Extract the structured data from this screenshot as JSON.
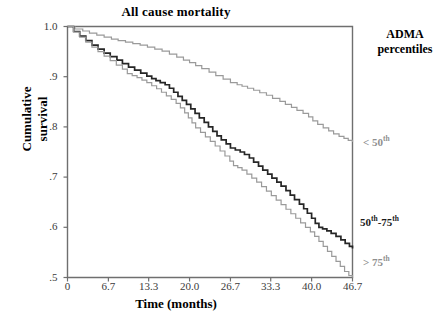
{
  "chart_data": {
    "type": "line",
    "title": "All cause mortality",
    "xlabel": "Time (months)",
    "ylabel": "Cumulative survival",
    "xlim": [
      0,
      46.7
    ],
    "ylim": [
      0.5,
      1.0
    ],
    "grid": false,
    "legend_position": "right",
    "legend_title": "ADMA percentiles",
    "xticks": [
      "0",
      "6.7",
      "13.3",
      "20.0",
      "26.7",
      "33.3",
      "40.0",
      "46.7"
    ],
    "xtick_values": [
      0,
      6.7,
      13.3,
      20.0,
      26.7,
      33.3,
      40.0,
      46.7
    ],
    "yticks": [
      "1.0",
      ".9",
      ".8",
      ".7",
      ".6",
      ".5"
    ],
    "ytick_values": [
      1.0,
      0.9,
      0.8,
      0.7,
      0.6,
      0.5
    ],
    "series": [
      {
        "name": "< 50th",
        "color": "#9a9a9a",
        "end_value": 0.77,
        "x": [
          0,
          1.2,
          2.5,
          3.6,
          4.8,
          6.0,
          7.2,
          8.3,
          9.5,
          10.7,
          11.9,
          13.1,
          14.3,
          15.5,
          16.7,
          17.9,
          19.0,
          20.0,
          21.0,
          22.0,
          23.2,
          24.3,
          25.5,
          26.7,
          27.8,
          28.6,
          29.5,
          30.5,
          31.5,
          32.6,
          33.6,
          34.8,
          35.7,
          36.7,
          37.6,
          38.6,
          39.5,
          40.2,
          41.0,
          41.9,
          42.8,
          43.6,
          44.5,
          45.3,
          46.0,
          46.7
        ],
        "y": [
          1.0,
          0.995,
          0.991,
          0.987,
          0.983,
          0.979,
          0.975,
          0.972,
          0.969,
          0.966,
          0.963,
          0.959,
          0.955,
          0.951,
          0.945,
          0.939,
          0.933,
          0.928,
          0.922,
          0.916,
          0.909,
          0.902,
          0.895,
          0.888,
          0.884,
          0.881,
          0.877,
          0.873,
          0.868,
          0.863,
          0.857,
          0.851,
          0.845,
          0.839,
          0.833,
          0.827,
          0.82,
          0.812,
          0.805,
          0.798,
          0.792,
          0.786,
          0.781,
          0.777,
          0.773,
          0.77
        ]
      },
      {
        "name": "50th-75th",
        "color": "#262626",
        "end_value": 0.56,
        "x": [
          0,
          1.0,
          2.0,
          3.0,
          4.0,
          5.0,
          6.0,
          7.0,
          8.1,
          9.0,
          10.0,
          11.0,
          12.0,
          13.0,
          13.8,
          14.5,
          15.2,
          16.0,
          16.7,
          17.4,
          18.1,
          18.8,
          19.5,
          20.2,
          20.9,
          21.6,
          22.4,
          23.1,
          23.8,
          24.5,
          25.2,
          26.0,
          26.7,
          27.5,
          28.3,
          29.0,
          29.8,
          30.5,
          31.3,
          32.0,
          32.8,
          33.5,
          34.3,
          35.0,
          35.8,
          36.5,
          37.2,
          38.0,
          38.7,
          39.3,
          40.0,
          40.6,
          41.2,
          41.8,
          42.5,
          43.2,
          44.0,
          44.8,
          45.5,
          46.2,
          46.7
        ],
        "y": [
          1.0,
          0.99,
          0.981,
          0.972,
          0.963,
          0.955,
          0.947,
          0.94,
          0.933,
          0.926,
          0.919,
          0.913,
          0.907,
          0.901,
          0.896,
          0.892,
          0.888,
          0.884,
          0.877,
          0.869,
          0.861,
          0.853,
          0.845,
          0.836,
          0.827,
          0.818,
          0.809,
          0.8,
          0.791,
          0.782,
          0.774,
          0.766,
          0.758,
          0.754,
          0.75,
          0.745,
          0.738,
          0.73,
          0.722,
          0.714,
          0.706,
          0.698,
          0.69,
          0.682,
          0.673,
          0.664,
          0.655,
          0.646,
          0.637,
          0.628,
          0.618,
          0.608,
          0.6,
          0.597,
          0.593,
          0.588,
          0.582,
          0.575,
          0.568,
          0.562,
          0.558
        ]
      },
      {
        "name": "> 75th",
        "color": "#9a9a9a",
        "end_value": 0.5,
        "x": [
          0,
          1.0,
          2.0,
          3.0,
          4.0,
          5.0,
          6.0,
          7.0,
          8.0,
          9.0,
          9.8,
          10.6,
          11.4,
          12.2,
          13.0,
          13.8,
          14.6,
          15.4,
          16.2,
          17.0,
          17.8,
          18.5,
          19.2,
          19.8,
          20.4,
          21.0,
          21.8,
          22.6,
          23.4,
          24.2,
          25.0,
          25.8,
          26.6,
          27.2,
          27.9,
          28.6,
          29.4,
          30.2,
          31.0,
          31.8,
          32.6,
          33.4,
          34.2,
          35.0,
          35.8,
          36.6,
          37.4,
          38.2,
          39.0,
          39.8,
          40.5,
          41.2,
          41.9,
          42.6,
          43.3,
          44.0,
          44.7,
          45.4,
          46.1,
          46.7
        ],
        "y": [
          1.0,
          0.989,
          0.979,
          0.969,
          0.959,
          0.95,
          0.941,
          0.932,
          0.923,
          0.915,
          0.906,
          0.902,
          0.898,
          0.893,
          0.888,
          0.882,
          0.876,
          0.869,
          0.862,
          0.855,
          0.847,
          0.838,
          0.828,
          0.818,
          0.808,
          0.798,
          0.789,
          0.78,
          0.771,
          0.762,
          0.752,
          0.742,
          0.732,
          0.723,
          0.719,
          0.714,
          0.706,
          0.698,
          0.69,
          0.681,
          0.672,
          0.663,
          0.654,
          0.645,
          0.636,
          0.627,
          0.618,
          0.609,
          0.6,
          0.591,
          0.582,
          0.572,
          0.562,
          0.552,
          0.542,
          0.532,
          0.522,
          0.512,
          0.504,
          0.5
        ]
      }
    ]
  },
  "legend": {
    "title_line1": "ADMA",
    "title_line2": "percentiles",
    "low_prefix": "< 50",
    "low_sup": "th",
    "mid_prefix": "50",
    "mid_sup1": "th",
    "mid_mid": "-75",
    "mid_sup2": "th",
    "high_prefix": "> 75",
    "high_sup": "th"
  },
  "axis": {
    "ylabel_line1": "Cumulative",
    "ylabel_line2": "survival"
  }
}
